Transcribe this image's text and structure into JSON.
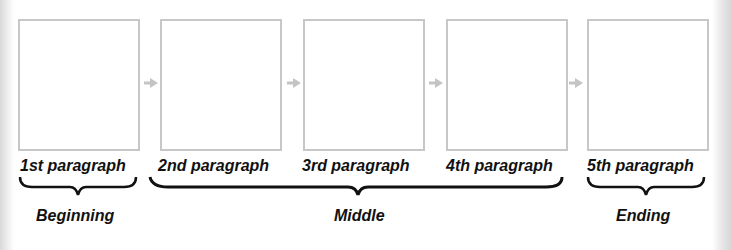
{
  "diagram": {
    "paragraphs": [
      {
        "label": "1st paragraph"
      },
      {
        "label": "2nd paragraph"
      },
      {
        "label": "3rd paragraph"
      },
      {
        "label": "4th paragraph"
      },
      {
        "label": "5th paragraph"
      }
    ],
    "groups": [
      {
        "label": "Beginning",
        "covers": [
          "1st paragraph"
        ]
      },
      {
        "label": "Middle",
        "covers": [
          "2nd paragraph",
          "3rd paragraph",
          "4th paragraph"
        ]
      },
      {
        "label": "Ending",
        "covers": [
          "5th paragraph"
        ]
      }
    ],
    "colors": {
      "box_border": "#c7c7c7",
      "arrow": "#c4c4c4",
      "text": "#111111"
    }
  }
}
